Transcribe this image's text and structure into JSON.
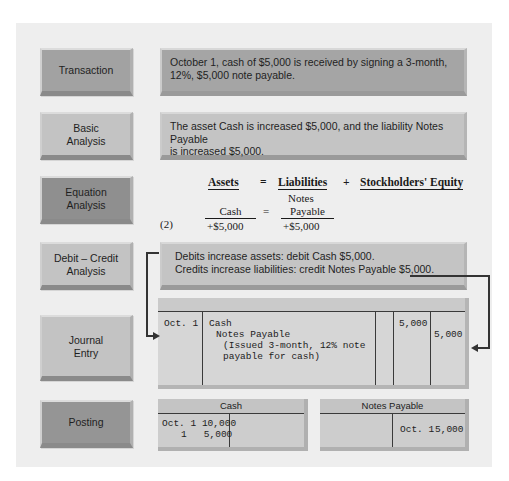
{
  "rows": {
    "transaction": {
      "label": "Transaction",
      "text_line1": "October 1, cash of $5,000 is received by signing a 3-month,",
      "text_line2": "12%, $5,000 note payable."
    },
    "basic_analysis": {
      "label_line1": "Basic",
      "label_line2": "Analysis",
      "text_line1": "The asset Cash is increased $5,000, and the liability Notes Payable",
      "text_line2": "is increased $5,000."
    },
    "equation_analysis": {
      "label_line1": "Equation",
      "label_line2": "Analysis",
      "header": {
        "assets": "Assets",
        "equals": "=",
        "liabilities": "Liabilities",
        "plus": "+",
        "equity": "Stockholders' Equity"
      },
      "row_number": "(2)",
      "asset_account": "Cash",
      "equals": "=",
      "liability_account_line1": "Notes",
      "liability_account_line2": "Payable",
      "asset_change": "+$5,000",
      "liability_change": "+$5,000"
    },
    "debit_credit_analysis": {
      "label_line1": "Debit – Credit",
      "label_line2": "Analysis",
      "text_line1": "Debits increase assets: debit Cash $5,000.",
      "text_line2": "Credits increase liabilities: credit Notes Payable $5,000."
    },
    "journal_entry": {
      "label_line1": "Journal",
      "label_line2": "Entry",
      "date": "Oct. 1",
      "debit_account": "Cash",
      "credit_account": "Notes Payable",
      "explanation_line1": "(Issued 3-month, 12% note",
      "explanation_line2": "payable for cash)",
      "debit_amount": "5,000",
      "credit_amount": "5,000"
    },
    "posting": {
      "label": "Posting",
      "cash_account": {
        "title": "Cash",
        "debit_line1": "Oct. 1 10,000",
        "debit_line2": "1   5,000"
      },
      "notes_payable_account": {
        "title": "Notes Payable",
        "credit_date": "Oct. 1",
        "credit_amount": "5,000"
      }
    }
  },
  "colors": {
    "panel": "#eeeeee",
    "box_dark": "#a2a2a2",
    "box_darkest": "#8f8f8f",
    "box_light": "#c3c3c3",
    "connector": "#333333"
  }
}
